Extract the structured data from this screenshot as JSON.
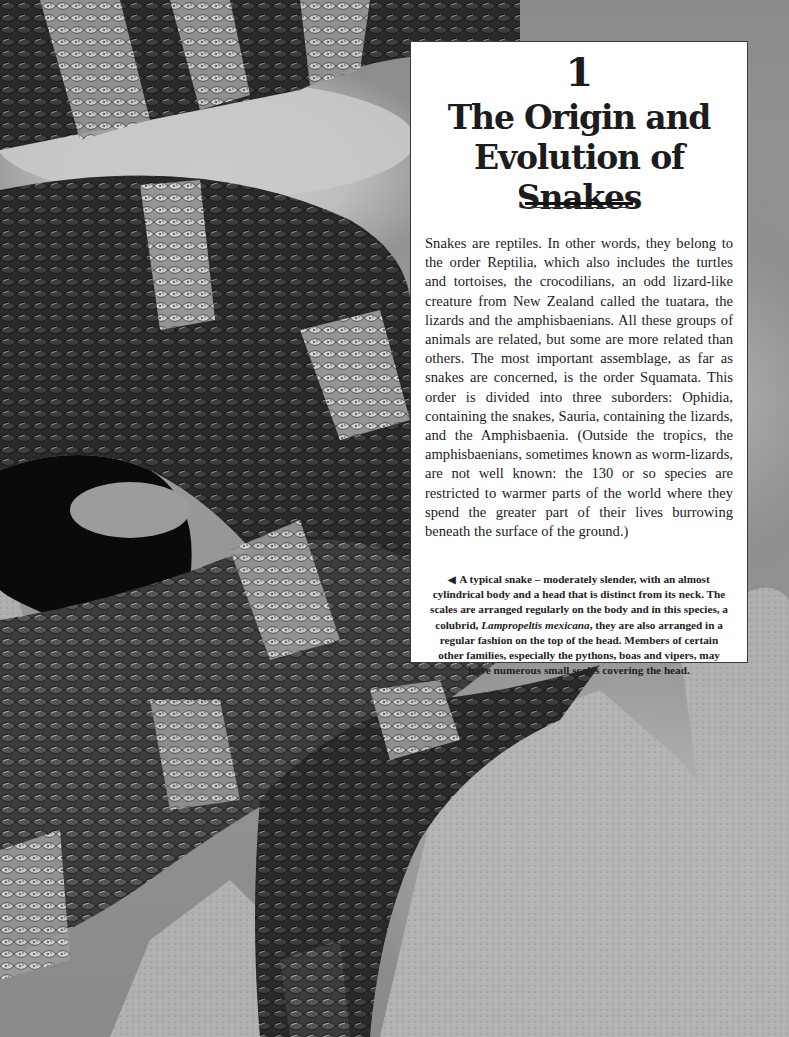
{
  "chapter": {
    "number": "1",
    "title": "The Origin and Evolution of Snakes"
  },
  "body": {
    "paragraph": "Snakes are reptiles. In other words, they belong to the order Reptilia, which also includes the turtles and tortoises, the crocodilians, an odd lizard-like creature from New Zealand called the tuatara, the lizards and the amphisbaenians. All these groups of animals are related, but some are more related than others. The most important assemblage, as far as snakes are concerned, is the order Squamata. This order is divided into three suborders: Ophidia, containing the snakes, Sauria, containing the lizards, and the Amphisbaenia. (Outside the tropics, the amphisbaenians, sometimes known as worm-lizards, are not well known: the 130 or so species are restricted to warmer parts of the world where they spend the greater part of their lives burrow­ing beneath the surface of the ground.)"
  },
  "caption": {
    "pointer_icon": "◀",
    "text_before": "A typical snake – moderately slender, with an almost cylindrical body and a head that is distinct from its neck. The scales are arranged regularly on the body and in this species, a colubrid, ",
    "species": "Lampropeltis mexicana",
    "text_after": ", they are also arranged in a regular fashion on the top of the head. Members of certain other families, especially the pythons, boas and vipers, may have numerous small scales covering the head."
  },
  "photo": {
    "subject": "coiled snake on rocks (grayscale photograph)"
  }
}
